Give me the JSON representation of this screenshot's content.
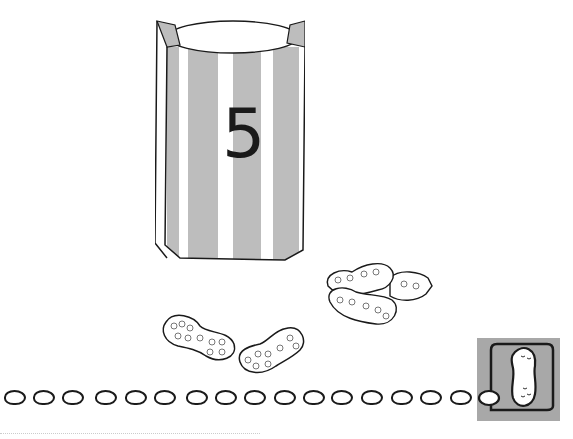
{
  "worksheet": {
    "bag": {
      "number": "5",
      "stripe_color": "#bdbdbd",
      "outline_color": "#1a1a1a"
    },
    "peanuts_shown": 5,
    "dot_row": {
      "count": 16
    },
    "answer_box": {
      "color": "#a8a8a8",
      "icon": "peanut-icon"
    }
  }
}
